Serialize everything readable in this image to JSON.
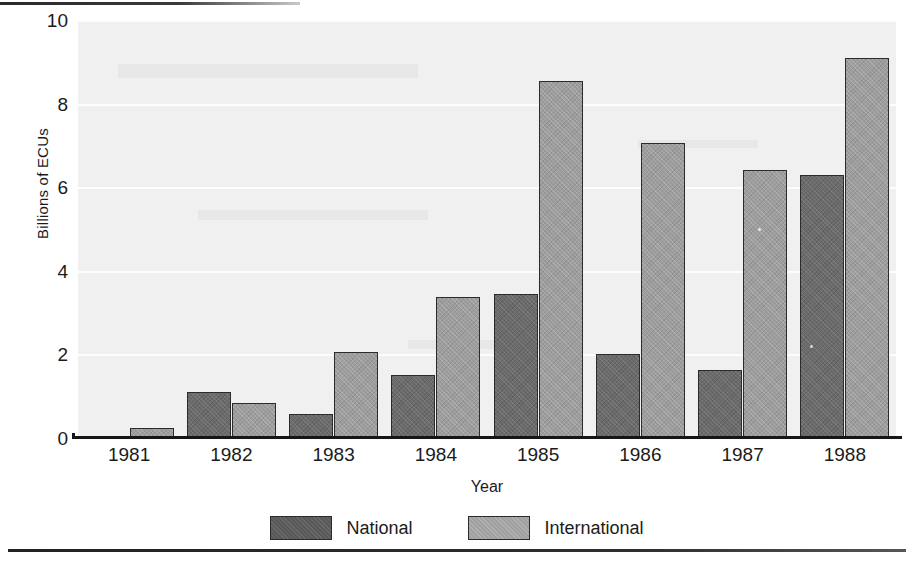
{
  "chart_data": {
    "type": "bar",
    "title": "",
    "xlabel": "Year",
    "ylabel": "Billions of ECUs",
    "categories": [
      "1981",
      "1982",
      "1983",
      "1984",
      "1985",
      "1986",
      "1987",
      "1988"
    ],
    "series": [
      {
        "name": "National",
        "values": [
          0.0,
          1.1,
          0.58,
          1.5,
          3.45,
          2.0,
          1.62,
          6.3
        ]
      },
      {
        "name": "International",
        "values": [
          0.24,
          0.83,
          2.05,
          3.38,
          8.55,
          7.05,
          6.4,
          9.1
        ]
      }
    ],
    "ylim": [
      0,
      10
    ],
    "yticks": [
      0,
      2,
      4,
      6,
      8,
      10
    ],
    "ytick_labels": [
      "0",
      "2",
      "4",
      "6",
      "8",
      "10"
    ],
    "grid": "horizontal-white-gridlines",
    "legend_position": "bottom-center",
    "colors": {
      "national": "#6b6b6b",
      "international": "#9d9d9d",
      "plot_background": "#f0f0f0",
      "axis": "#161616",
      "gridline": "#fdfdfd"
    }
  },
  "axis": {
    "y_title": "Billions of ECUs",
    "x_title": "Year"
  },
  "legend": {
    "entries": [
      {
        "label": "National"
      },
      {
        "label": "International"
      }
    ]
  }
}
